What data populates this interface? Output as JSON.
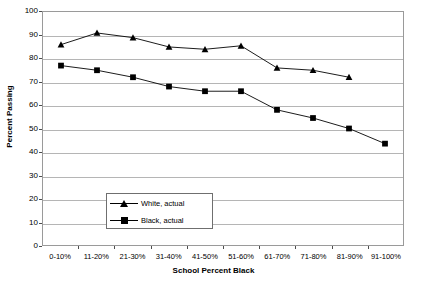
{
  "chart_data": {
    "type": "line",
    "title": "",
    "xlabel": "School Percent Black",
    "ylabel": "Percent Passing",
    "ylim": [
      0,
      100
    ],
    "ytick_step": 10,
    "grid": true,
    "legend_position": "inside-lower-left",
    "categories": [
      "0-10%",
      "11-20%",
      "21-30%",
      "31-40%",
      "41-50%",
      "51-60%",
      "61-70%",
      "71-80%",
      "81-90%",
      "91-100%"
    ],
    "yticks": [
      "0",
      "10",
      "20",
      "30",
      "40",
      "50",
      "60",
      "70",
      "80",
      "90",
      "100"
    ],
    "series": [
      {
        "name": "White, actual",
        "marker": "triangle",
        "color": "#000000",
        "values": [
          86,
          91,
          89,
          85,
          84,
          85.5,
          76,
          75,
          72,
          null
        ]
      },
      {
        "name": "Black, actual",
        "marker": "square",
        "color": "#000000",
        "values": [
          77,
          75,
          72,
          68,
          66,
          66,
          58,
          54.5,
          50,
          43.5
        ]
      }
    ]
  },
  "legend": {
    "entries": [
      {
        "label": "White, actual"
      },
      {
        "label": "Black, actual"
      }
    ]
  }
}
